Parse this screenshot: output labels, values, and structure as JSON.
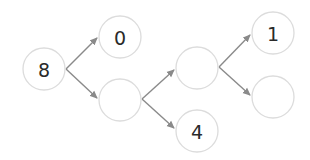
{
  "diagram": {
    "type": "number-decomposition-tree",
    "nodes": [
      {
        "id": "n8",
        "value": "8"
      },
      {
        "id": "n0",
        "value": "0"
      },
      {
        "id": "nA",
        "value": ""
      },
      {
        "id": "nB",
        "value": ""
      },
      {
        "id": "n4",
        "value": "4"
      },
      {
        "id": "n1",
        "value": "1"
      },
      {
        "id": "nC",
        "value": ""
      }
    ],
    "edges": [
      {
        "from": "n8",
        "to": "n0"
      },
      {
        "from": "n8",
        "to": "nA"
      },
      {
        "from": "nA",
        "to": "nB"
      },
      {
        "from": "nA",
        "to": "n4"
      },
      {
        "from": "nB",
        "to": "n1"
      },
      {
        "from": "nB",
        "to": "nC"
      }
    ],
    "colors": {
      "node_stroke": "#dcdcdc",
      "edge": "#8a8a8a",
      "text": "#2a2a2a"
    }
  }
}
